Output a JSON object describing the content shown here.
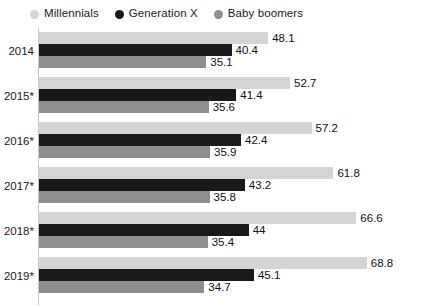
{
  "legend": {
    "position": "top-left",
    "items": [
      {
        "label": "Millennials",
        "color": "#d4d4d4",
        "marker": "circle-swatch-icon"
      },
      {
        "label": "Generation X",
        "color": "#191919",
        "marker": "circle-swatch-icon"
      },
      {
        "label": "Baby boomers",
        "color": "#8e8e8e",
        "marker": "circle-swatch-icon"
      }
    ]
  },
  "chart_data": {
    "type": "bar",
    "orientation": "horizontal",
    "title": "",
    "subtitle": "",
    "xlabel": "",
    "ylabel": "",
    "grid": false,
    "legend_position": "top-left",
    "xlim": [
      0,
      68.8
    ],
    "categories": [
      "2014",
      "2015*",
      "2016*",
      "2017*",
      "2018*",
      "2019*"
    ],
    "series": [
      {
        "name": "Millennials",
        "color": "#d4d4d4",
        "values": [
          48.1,
          52.7,
          57.2,
          61.8,
          66.6,
          68.8
        ],
        "labels": [
          "48.1",
          "52.7",
          "57.2",
          "61.8",
          "66.6",
          "68.8"
        ]
      },
      {
        "name": "Generation X",
        "color": "#191919",
        "values": [
          40.4,
          41.4,
          42.4,
          43.2,
          44,
          45.1
        ],
        "labels": [
          "40.4",
          "41.4",
          "42.4",
          "43.2",
          "44",
          "45.1"
        ]
      },
      {
        "name": "Baby boomers",
        "color": "#8e8e8e",
        "values": [
          35.1,
          35.6,
          35.9,
          35.8,
          35.4,
          34.7
        ],
        "labels": [
          "35.1",
          "35.6",
          "35.9",
          "35.8",
          "35.4",
          "34.7"
        ]
      }
    ]
  },
  "layout": {
    "plot_left_px": 39,
    "px_per_unit": 4.765,
    "group_tops_px": [
      6,
      51,
      96,
      141,
      186,
      231
    ],
    "bar_height_px": 12
  }
}
